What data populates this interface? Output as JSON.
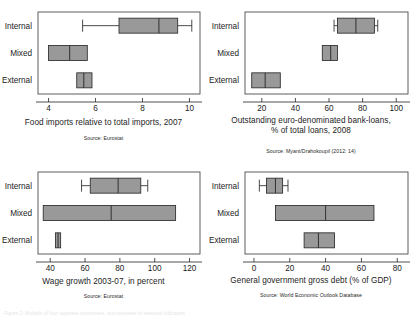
{
  "figure": {
    "layout": "2x2 grid of horizontal box plots",
    "categories": [
      "Internal",
      "Mixed",
      "External"
    ],
    "box_fill": "#999999",
    "box_stroke": "#2b2b2b",
    "frame_stroke": "#4d4d4d",
    "background": "#ffffff",
    "footer_ghost_text": "Figure 2: Multiple of four separate economies, and overview of selected indicators"
  },
  "chart_data": [
    {
      "id": "food-imports",
      "type": "box",
      "title": "Food imports relative to total imports, 2007",
      "source": "Source: Eurostat",
      "xlabel": "",
      "ylabel": "",
      "categories": [
        "Internal",
        "Mixed",
        "External"
      ],
      "xlim": [
        3.55,
        10.45
      ],
      "xticks": [
        4,
        6,
        8,
        10
      ],
      "xticklabels": [
        "4",
        "6",
        "8",
        "10"
      ],
      "grid": false,
      "boxes": [
        {
          "category": "Internal",
          "whisker_low": 5.45,
          "q1": 7.0,
          "median": 8.7,
          "q3": 9.5,
          "whisker_high": 10.1
        },
        {
          "category": "Mixed",
          "whisker_low": 4.0,
          "q1": 4.0,
          "median": 4.9,
          "q3": 5.65,
          "whisker_high": 5.65
        },
        {
          "category": "External",
          "whisker_low": 5.2,
          "q1": 5.2,
          "median": 5.5,
          "q3": 5.85,
          "whisker_high": 5.85
        }
      ]
    },
    {
      "id": "euro-bank-loans",
      "type": "box",
      "title": "Outstanding euro-denominated bank-loans,",
      "title_line2": "% of total loans, 2008",
      "source": "Source: Myant/Drahokoupil (2012: 14)",
      "xlabel": "",
      "ylabel": "",
      "categories": [
        "Internal",
        "Mixed",
        "External"
      ],
      "xlim": [
        10,
        107
      ],
      "xticks": [
        20,
        40,
        60,
        80,
        100
      ],
      "xticklabels": [
        "20",
        "40",
        "60",
        "80",
        "100"
      ],
      "grid": false,
      "boxes": [
        {
          "category": "Internal",
          "whisker_low": 63.0,
          "q1": 65.0,
          "median": 76.0,
          "q3": 87.0,
          "whisker_high": 89.0
        },
        {
          "category": "Mixed",
          "whisker_low": 56.0,
          "q1": 56.0,
          "median": 61.0,
          "q3": 65.0,
          "whisker_high": 65.0
        },
        {
          "category": "External",
          "whisker_low": 14.0,
          "q1": 14.0,
          "median": 22.0,
          "q3": 31.0,
          "whisker_high": 31.0
        }
      ]
    },
    {
      "id": "wage-growth",
      "type": "box",
      "title": "Wage growth 2003-07, in percent",
      "source": "Source: Eurostat",
      "xlabel": "",
      "ylabel": "",
      "categories": [
        "Internal",
        "Mixed",
        "External"
      ],
      "xlim": [
        33,
        126
      ],
      "xticks": [
        40,
        60,
        80,
        100,
        120
      ],
      "xticklabels": [
        "40",
        "60",
        "80",
        "100",
        "120"
      ],
      "grid": false,
      "boxes": [
        {
          "category": "Internal",
          "whisker_low": 58.0,
          "q1": 63.0,
          "median": 79.0,
          "q3": 92.0,
          "whisker_high": 96.0
        },
        {
          "category": "Mixed",
          "whisker_low": 36.0,
          "q1": 36.0,
          "median": 75.0,
          "q3": 112.0,
          "whisker_high": 112.0
        },
        {
          "category": "External",
          "whisker_low": 43.0,
          "q1": 43.0,
          "median": 44.5,
          "q3": 46.0,
          "whisker_high": 46.0
        }
      ]
    },
    {
      "id": "gross-debt",
      "type": "box",
      "title": "General government gross debt (% of GDP)",
      "source": "Source: World Economic Outlook Database",
      "xlabel": "",
      "ylabel": "",
      "categories": [
        "Internal",
        "Mixed",
        "External"
      ],
      "xlim": [
        -5,
        86
      ],
      "xticks": [
        0,
        20,
        40,
        60,
        80
      ],
      "xticklabels": [
        "0",
        "20",
        "40",
        "60",
        "80"
      ],
      "grid": false,
      "boxes": [
        {
          "category": "Internal",
          "whisker_low": 3.0,
          "q1": 7.0,
          "median": 12.0,
          "q3": 16.0,
          "whisker_high": 19.0
        },
        {
          "category": "Mixed",
          "whisker_low": 12.0,
          "q1": 12.0,
          "median": 40.0,
          "q3": 67.0,
          "whisker_high": 67.0
        },
        {
          "category": "External",
          "whisker_low": 28.0,
          "q1": 28.0,
          "median": 36.0,
          "q3": 45.0,
          "whisker_high": 45.0
        }
      ]
    }
  ]
}
